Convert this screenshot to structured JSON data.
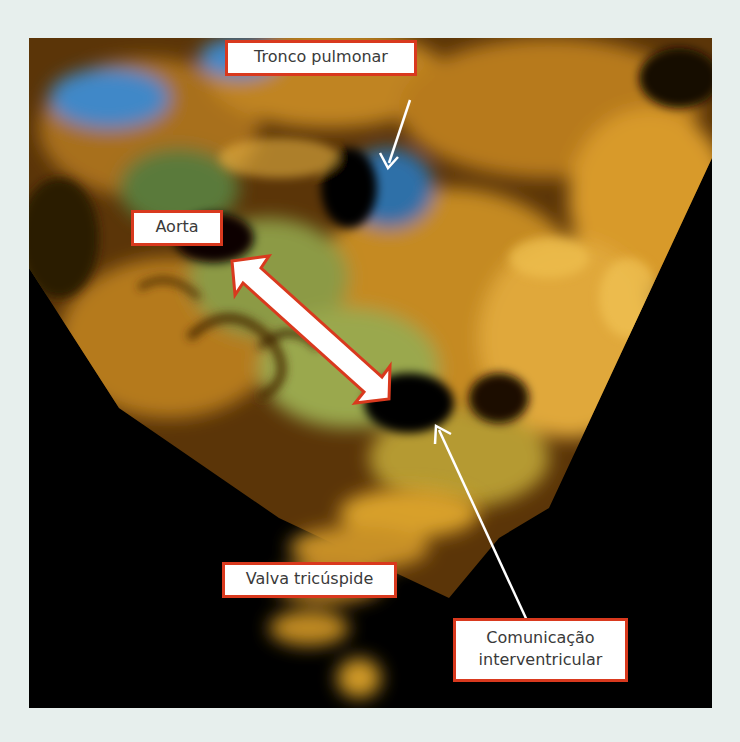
{
  "figure": {
    "type": "3D echocardiography (color Doppler volume render)",
    "background_color": "#e7efed",
    "label_border_color": "#d9391e",
    "label_text_color": "#3a3a3a",
    "labels": [
      {
        "id": "tronco-pulmonar",
        "text": "Tronco pulmonar"
      },
      {
        "id": "aorta",
        "text": "Aorta"
      },
      {
        "id": "valva-tricuspide",
        "text": "Valva tricúspide"
      },
      {
        "id": "comunicacao-interventricular",
        "line1": "Comunicação",
        "line2": "interventricular"
      }
    ],
    "arrows": [
      {
        "id": "arrow-tronco-pulmonar",
        "style": "thin-white",
        "from": "Tronco pulmonar label",
        "to": "pulmonary trunk lumen"
      },
      {
        "id": "arrow-comunicacao",
        "style": "thin-white",
        "from": "Comunicação interventricular label",
        "to": "septal defect"
      },
      {
        "id": "double-arrow-aorta-defect",
        "style": "thick-white-red-outline-double-headed",
        "between": "Aorta and ventricular septal defect"
      }
    ]
  }
}
